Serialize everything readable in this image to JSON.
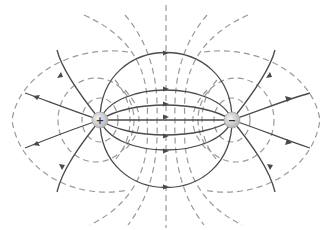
{
  "diagram": {
    "type": "electric-dipole-field",
    "colors": {
      "field_line": "#4a4a4a",
      "equipotential_line": "#9a9a9a",
      "charge_fill": "#d8d8d8",
      "background": "#ffffff"
    },
    "charges": [
      {
        "id": "positive",
        "sign": "+",
        "x": 100,
        "y": 120
      },
      {
        "id": "negative",
        "sign": "−",
        "x": 232,
        "y": 120
      }
    ],
    "legend": {
      "field_lines": "solid",
      "equipotential_lines": "dashed"
    }
  }
}
